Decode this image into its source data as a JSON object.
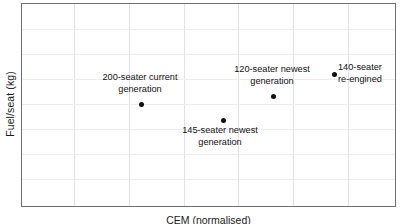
{
  "chart_data": {
    "type": "scatter",
    "title": "",
    "xlabel": "CEM (normalised)",
    "ylabel": "Fuel/seat (kg)",
    "xlabel_clipped": true,
    "grid": true,
    "legend": "none",
    "x_tick_labels": [],
    "y_tick_labels": [],
    "xlim": [
      0,
      1
    ],
    "ylim": [
      0,
      1
    ],
    "points": [
      {
        "label": "200-seater current\ngeneration",
        "label_line1": "200-seater current",
        "label_line2": "generation",
        "x": 0.317,
        "y": 0.51,
        "px": 140,
        "py": 103
      },
      {
        "label": "145-seater newest\ngeneration",
        "label_line1": "145-seater newest",
        "label_line2": "generation",
        "x": 0.536,
        "y": 0.431,
        "px": 222,
        "py": 119
      },
      {
        "label": "120-seater newest\ngeneration",
        "label_line1": "120-seater newest",
        "label_line2": "generation",
        "x": 0.669,
        "y": 0.549,
        "px": 272,
        "py": 95
      },
      {
        "label": "140-seater\nre-engined",
        "label_line1": "140-seater",
        "label_line2": "re-engined",
        "x": 0.832,
        "y": 0.657,
        "px": 333,
        "py": 73
      }
    ],
    "gridlines_x_px": [
      73,
      128,
      183,
      237,
      292,
      347
    ],
    "gridlines_y_px": [
      28,
      53,
      78,
      103,
      128,
      153,
      178
    ],
    "colors": {
      "marker": "#111111",
      "frame": "#6e6e6e",
      "gridline_vertical": "#e2e2e4",
      "gridline_horizontal": "#ededef",
      "background": "#ffffff",
      "text": "#111111"
    }
  }
}
